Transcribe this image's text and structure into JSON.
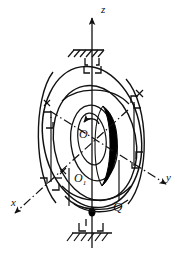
{
  "figure": {
    "background_color": "#ffffff",
    "ink_color": "#111111",
    "rotor_color": "#000000",
    "axes": [
      {
        "id": "z",
        "label": "z",
        "style": "solid",
        "direction": "up",
        "arrow": true
      },
      {
        "id": "y",
        "label": "y",
        "style": "dash-dot",
        "direction": "down-right",
        "arrow": true
      },
      {
        "id": "x",
        "label": "x",
        "style": "dash-dot",
        "direction": "down-left",
        "arrow": true
      }
    ],
    "points": [
      {
        "id": "O",
        "label": "O",
        "sub": ""
      },
      {
        "id": "O1",
        "label": "O",
        "sub": "1"
      },
      {
        "id": "Q",
        "label": "Q",
        "sub": ""
      }
    ],
    "supports": [
      {
        "id": "top-support",
        "type": "hatched-ground-bearing",
        "position": "top"
      },
      {
        "id": "bottom-support",
        "type": "hatched-ground-bearing",
        "position": "bottom"
      }
    ],
    "elements": [
      {
        "id": "outer-gimbal-ring",
        "type": "ellipse"
      },
      {
        "id": "middle-gimbal-ring",
        "type": "ellipse"
      },
      {
        "id": "inner-gimbal-ring",
        "type": "ellipse"
      },
      {
        "id": "rotor-disc",
        "type": "filled-crescent"
      },
      {
        "id": "spin-arrow",
        "type": "curved-arrow",
        "direction": "counterclockwise"
      }
    ]
  }
}
